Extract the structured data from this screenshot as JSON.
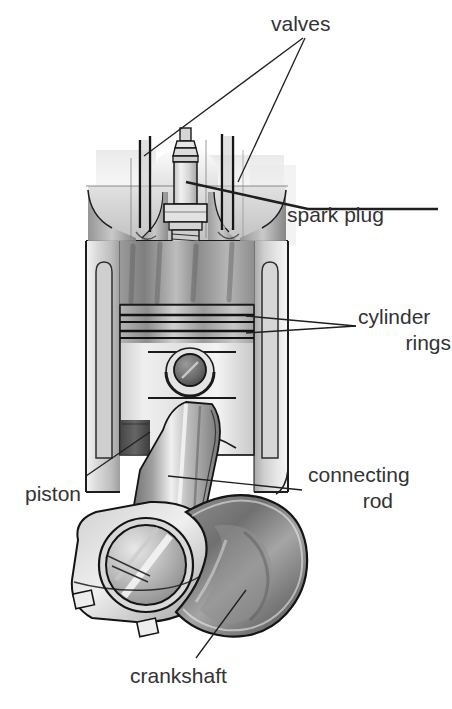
{
  "figure": {
    "style": "grayscale pencil/airbrush technical illustration on white background",
    "labels": [
      {
        "id": "valves",
        "text": "valves",
        "lines": [
          "valves"
        ]
      },
      {
        "id": "spark-plug",
        "text": "spark plug",
        "lines": [
          "spark plug"
        ]
      },
      {
        "id": "cylinder-rings",
        "text": "cylinder rings",
        "lines": [
          "cylinder",
          "rings"
        ]
      },
      {
        "id": "piston",
        "text": "piston",
        "lines": [
          "piston"
        ]
      },
      {
        "id": "connecting-rod",
        "text": "connecting rod",
        "lines": [
          "connecting",
          "rod"
        ]
      },
      {
        "id": "crankshaft",
        "text": "crankshaft",
        "lines": [
          "crankshaft"
        ]
      }
    ],
    "parts": [
      "cylinder head",
      "intake valve",
      "exhaust valve",
      "spark plug",
      "combustion chamber",
      "piston crown",
      "piston rings",
      "wrist pin",
      "piston skirt",
      "cylinder wall",
      "connecting rod",
      "big end bearing cap",
      "crankshaft counterweight",
      "crank journal"
    ],
    "colors": {
      "background": "#ffffff",
      "ink": "#1b1b1b",
      "leader_line": "#222222",
      "label_text": "#333333",
      "metal_light": "#e9e9e9",
      "metal_mid": "#b9b9b9",
      "metal_dark": "#7d7d7d",
      "shadow": "#4e4e4e"
    }
  },
  "labels": {
    "valves": "valves",
    "spark_plug": "spark plug",
    "cylinder": "cylinder",
    "rings": "rings",
    "piston": "piston",
    "connecting": "connecting",
    "rod": "rod",
    "crankshaft": "crankshaft"
  }
}
